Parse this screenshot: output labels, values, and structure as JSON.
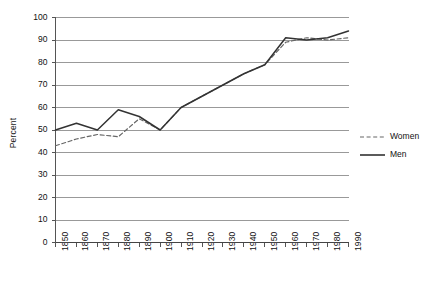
{
  "chart_data": {
    "type": "line",
    "title": "",
    "xlabel": "",
    "ylabel": "Percent",
    "ylim": [
      0,
      100
    ],
    "ytick_step": 10,
    "yticks": [
      0,
      10,
      20,
      30,
      40,
      50,
      60,
      70,
      80,
      90,
      100
    ],
    "grid": true,
    "legend_position": "right",
    "categories": [
      1850,
      1860,
      1870,
      1880,
      1890,
      1900,
      1910,
      1920,
      1930,
      1940,
      1950,
      1960,
      1970,
      1980,
      1990
    ],
    "xtick_labels": [
      "1850",
      "1860",
      "1870",
      "1880",
      "1890",
      "1900",
      "1910",
      "1920",
      "1930",
      "1940",
      "1950",
      "1960",
      "1970",
      "1980",
      "1990"
    ],
    "series": [
      {
        "name": "Women",
        "style": "dashed",
        "color": "#666666",
        "values": [
          43,
          46,
          48,
          47,
          55,
          50,
          60,
          65,
          70,
          75,
          79,
          89,
          91,
          90,
          91
        ]
      },
      {
        "name": "Men",
        "style": "solid",
        "color": "#333333",
        "values": [
          50,
          53,
          50,
          59,
          56,
          50,
          60,
          65,
          70,
          75,
          79,
          91,
          90,
          91,
          94
        ]
      }
    ]
  },
  "legend": {
    "items": [
      {
        "label": "Women",
        "style": "dashed"
      },
      {
        "label": "Men",
        "style": "solid"
      }
    ]
  },
  "colors": {
    "grid": "#999999",
    "axis": "#555555",
    "men": "#333333",
    "women": "#666666",
    "text": "#111111"
  }
}
